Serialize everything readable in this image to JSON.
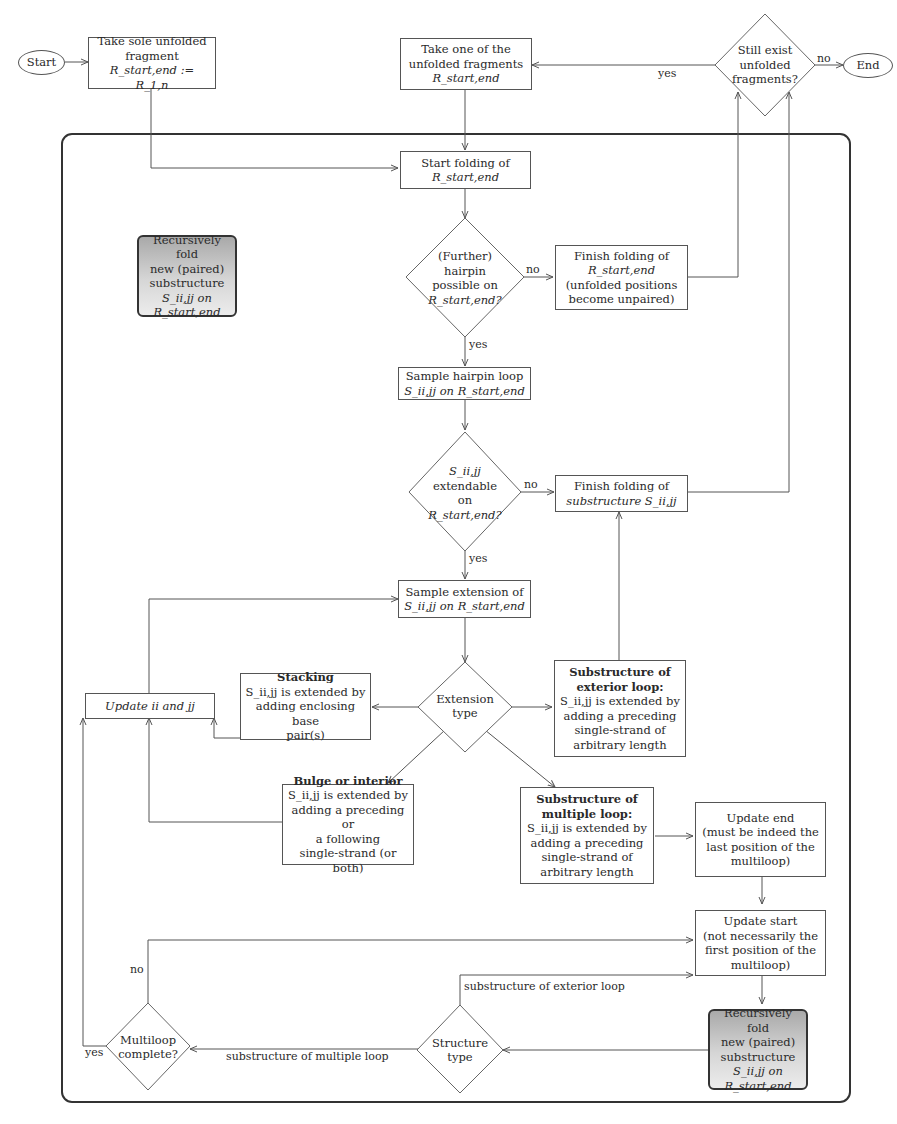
{
  "nodes": {
    "start": "Start",
    "end": "End",
    "take_sole": [
      "Take sole unfolded",
      "fragment",
      "R_start,end := R_1,n"
    ],
    "take_one": [
      "Take one of the",
      "unfolded fragments",
      "R_start,end"
    ],
    "still_exist": [
      "Still exist",
      "unfolded",
      "fragments?"
    ],
    "start_folding": [
      "Start folding of",
      "R_start,end"
    ],
    "recursive_legend": [
      "Recursively fold",
      "new (paired)",
      "substructure",
      "S_ii,jj on",
      "R_start,end"
    ],
    "further_hairpin": [
      "(Further)",
      "hairpin",
      "possible on",
      "R_start,end?"
    ],
    "finish_folding_r": [
      "Finish folding of",
      "R_start,end",
      "(unfolded positions",
      "become unpaired)"
    ],
    "sample_hairpin": [
      "Sample hairpin loop",
      "S_ii,jj on R_start,end"
    ],
    "extendable": [
      "S_ii,jj",
      "extendable",
      "on",
      "R_start,end?"
    ],
    "finish_sub": [
      "Finish folding of",
      "substructure S_ii,jj"
    ],
    "sample_extension": [
      "Sample extension of",
      "S_ii,jj on R_start,end"
    ],
    "extension_type": [
      "Extension",
      "type"
    ],
    "update_iijj": "Update ii and jj",
    "stacking": {
      "title": "Stacking",
      "lines": [
        "S_ii,jj is extended by",
        "adding enclosing base",
        "pair(s)"
      ]
    },
    "exterior": {
      "title": [
        "Substructure of",
        "exterior loop:"
      ],
      "lines": [
        "S_ii,jj is extended by",
        "adding a preceding",
        "single-strand of",
        "arbitrary length"
      ]
    },
    "bulge": {
      "title": "Bulge or interior",
      "lines": [
        "S_ii,jj is extended by",
        "adding a preceding or",
        "a following",
        "single-strand (or both)"
      ]
    },
    "multiple": {
      "title": [
        "Substructure of",
        "multiple loop:"
      ],
      "lines": [
        "S_ii,jj is extended by",
        "adding a preceding",
        "single-strand of",
        "arbitrary length"
      ]
    },
    "update_end": [
      "Update end",
      "(must be indeed the",
      "last position of the",
      "multiloop)"
    ],
    "update_start": [
      "Update start",
      "(not necessarily the",
      "first position of the",
      "multiloop)"
    ],
    "recursive_fold": [
      "Recursively fold",
      "new (paired)",
      "substructure",
      "S_ii,jj on",
      "R_start,end"
    ],
    "structure_type": [
      "Structure",
      "type"
    ],
    "multiloop_complete": [
      "Multiloop",
      "complete?"
    ]
  },
  "edge_labels": {
    "yes_top": "yes",
    "no_top": "no",
    "no_hairpin": "no",
    "yes_hairpin": "yes",
    "no_ext": "no",
    "yes_ext": "yes",
    "sub_exterior": "substructure of exterior loop",
    "sub_multiple": "substructure of multiple loop",
    "no_multi": "no",
    "yes_multi": "yes"
  },
  "colors": {
    "line": "#555555",
    "frame": "#333333",
    "shade_top": "#a9a9a9",
    "shade_bottom": "#ececec"
  }
}
